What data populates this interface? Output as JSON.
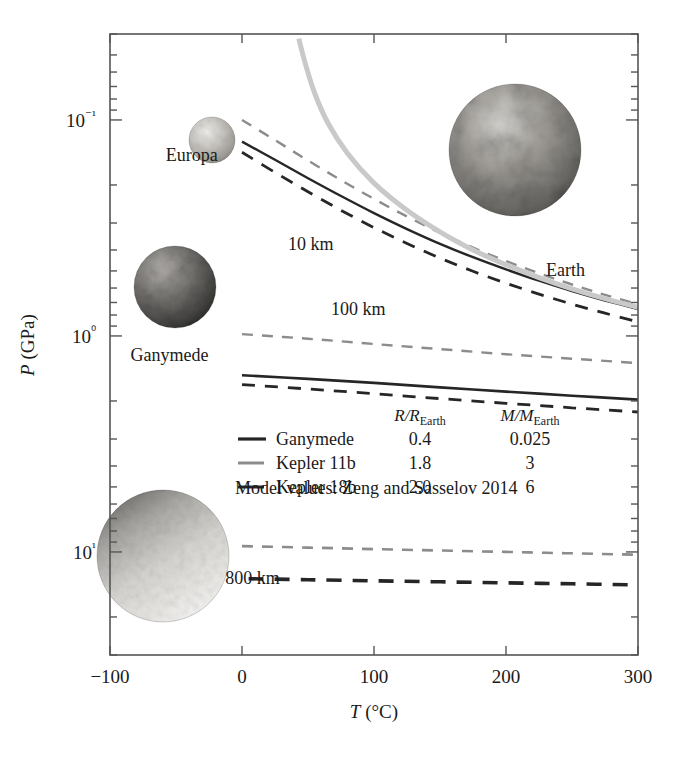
{
  "chart_data": {
    "type": "line",
    "title": "",
    "xlabel": "T (°C)",
    "ylabel": "P (GPa)",
    "xlim": [
      -100,
      300
    ],
    "ylim": [
      0.04,
      30
    ],
    "yscale": "log",
    "y_inverted": true,
    "grid": false,
    "legend_position": "center-bottom-inside",
    "xticks": [
      -100,
      0,
      100,
      200,
      300
    ],
    "xticklabels": [
      "−100",
      "0",
      "100",
      "200",
      "300"
    ],
    "yticks": [
      0.1,
      1,
      10
    ],
    "yticklabels": [
      "10⁻¹",
      "10⁰",
      "10¹"
    ],
    "annotations": [
      {
        "text": "10 km",
        "x": 52,
        "y": 0.4
      },
      {
        "text": "100 km",
        "x": 88,
        "y": 0.8
      },
      {
        "text": "800 km",
        "x": 8,
        "y": 14.0
      },
      {
        "text": "Europa",
        "x": -38,
        "y": 0.155
      },
      {
        "text": "Ganymede",
        "x": -55,
        "y": 1.3
      },
      {
        "text": "Earth",
        "x": 245,
        "y": 0.53
      }
    ],
    "series": [
      {
        "name": "Ganymede 10 km",
        "style": "solid",
        "color": "#262626",
        "width": 2.4,
        "x": [
          0,
          25,
          50,
          75,
          100,
          125,
          150,
          175,
          200,
          225,
          250,
          275,
          300
        ],
        "y": [
          0.126,
          0.153,
          0.186,
          0.225,
          0.27,
          0.32,
          0.375,
          0.432,
          0.492,
          0.555,
          0.62,
          0.685,
          0.75
        ]
      },
      {
        "name": "Kepler 11b 10 km",
        "style": "dashed",
        "color": "#8c8c8c",
        "width": 2.4,
        "x": [
          0,
          25,
          50,
          75,
          100,
          125,
          150,
          175,
          200,
          225,
          250,
          275,
          300
        ],
        "y": [
          0.1,
          0.124,
          0.154,
          0.19,
          0.232,
          0.28,
          0.333,
          0.39,
          0.45,
          0.513,
          0.578,
          0.645,
          0.712
        ]
      },
      {
        "name": "Kepler 18b 10 km",
        "style": "dashed",
        "color": "#262626",
        "width": 2.8,
        "x": [
          0,
          25,
          50,
          75,
          100,
          125,
          150,
          175,
          200,
          225,
          250,
          275,
          300
        ],
        "y": [
          0.141,
          0.175,
          0.215,
          0.262,
          0.315,
          0.373,
          0.436,
          0.502,
          0.57,
          0.64,
          0.712,
          0.785,
          0.86
        ]
      },
      {
        "name": "Earth melting curve",
        "style": "solid",
        "color": "#c9c9c9",
        "width": 5.0,
        "x": [
          43,
          48,
          55,
          65,
          80,
          100,
          125,
          150,
          175,
          200,
          225,
          250,
          275,
          300
        ],
        "y": [
          0.042,
          0.055,
          0.075,
          0.103,
          0.143,
          0.196,
          0.262,
          0.33,
          0.4,
          0.468,
          0.537,
          0.605,
          0.672,
          0.738
        ]
      },
      {
        "name": "Kepler 11b 100 km",
        "style": "dashed",
        "color": "#8c8c8c",
        "width": 2.4,
        "x": [
          0,
          50,
          100,
          150,
          200,
          250,
          300
        ],
        "y": [
          0.98,
          1.03,
          1.09,
          1.15,
          1.215,
          1.275,
          1.335
        ]
      },
      {
        "name": "Ganymede 100 km",
        "style": "solid",
        "color": "#262626",
        "width": 2.6,
        "x": [
          0,
          50,
          100,
          150,
          200,
          250,
          300
        ],
        "y": [
          1.52,
          1.58,
          1.65,
          1.73,
          1.81,
          1.89,
          1.97
        ]
      },
      {
        "name": "Kepler 18b 100 km",
        "style": "dashed",
        "color": "#262626",
        "width": 2.8,
        "x": [
          0,
          50,
          100,
          150,
          200,
          250,
          300
        ],
        "y": [
          1.68,
          1.76,
          1.85,
          1.95,
          2.05,
          2.15,
          2.25
        ]
      },
      {
        "name": "Kepler 11b 800 km",
        "style": "dashed",
        "color": "#8c8c8c",
        "width": 2.6,
        "x": [
          0,
          50,
          100,
          150,
          200,
          250,
          300
        ],
        "y": [
          9.4,
          9.55,
          9.7,
          9.85,
          10.0,
          10.15,
          10.3
        ]
      },
      {
        "name": "Kepler 18b 800 km",
        "style": "dashed",
        "color": "#262626",
        "width": 3.6,
        "x": [
          5,
          50,
          100,
          150,
          200,
          250,
          300
        ],
        "y": [
          13.3,
          13.45,
          13.6,
          13.75,
          13.9,
          14.05,
          14.2
        ]
      }
    ],
    "legend": {
      "columns": [
        "",
        "R/R_Earth",
        "M/M_Earth"
      ],
      "col_r_label": "R/R",
      "col_r_sub": "Earth",
      "col_m_label": "M/M",
      "col_m_sub": "Earth",
      "rows": [
        {
          "name": "Ganymede",
          "style": "solid",
          "color": "#262626",
          "radius": "0.4",
          "mass": "0.025"
        },
        {
          "name": "Kepler 11b",
          "style": "dashed",
          "color": "#8c8c8c",
          "radius": "1.8",
          "mass": "3"
        },
        {
          "name": "Kepler 18b",
          "style": "dashed",
          "color": "#262626",
          "radius": "2.0",
          "mass": "6"
        }
      ],
      "footnote": "Model values: Zeng and Sasselov 2014"
    },
    "bodies": [
      {
        "name": "Europa",
        "label": "Europa",
        "cx": 212,
        "cy": 140,
        "r": 23,
        "tone": "#b9b6b1"
      },
      {
        "name": "Ganymede",
        "label": "Ganymede",
        "cx": 175,
        "cy": 287,
        "r": 41,
        "tone": "#595755"
      },
      {
        "name": "Earth",
        "label": "Earth",
        "cx": 515,
        "cy": 150,
        "r": 66,
        "tone": "#8f8d8a"
      },
      {
        "name": "WaterWorld",
        "label": "",
        "cx": 163,
        "cy": 556,
        "r": 66,
        "tone": "#c3c1bd"
      }
    ]
  }
}
